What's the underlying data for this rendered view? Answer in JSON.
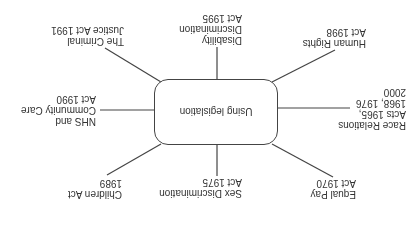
{
  "diagram": {
    "type": "mind-map",
    "orientation": "rotated 180 degrees",
    "center": "Using legislation",
    "branches": [
      {
        "id": "race",
        "lines": [
          "Race Relations",
          "Acts 1965,",
          "1968, 1976",
          "2000"
        ]
      },
      {
        "id": "human-rights",
        "lines": [
          "Human Rights",
          "Act 1998"
        ]
      },
      {
        "id": "disability",
        "lines": [
          "Disability",
          "Discrimination",
          "Act 1995"
        ]
      },
      {
        "id": "criminal",
        "lines": [
          "The Criminal",
          "Justice Act 1991"
        ]
      },
      {
        "id": "nhs",
        "lines": [
          "NHS and",
          "Community Care",
          "Act 1990"
        ]
      },
      {
        "id": "children",
        "lines": [
          "Children Act",
          "1989"
        ]
      },
      {
        "id": "sex",
        "lines": [
          "Sex Discrimination",
          "Act 1975"
        ]
      },
      {
        "id": "equal-pay",
        "lines": [
          "Equal Pay",
          "Act 1970"
        ]
      }
    ]
  },
  "colors": {
    "line": "#444444",
    "text": "#333333",
    "background": "#ffffff"
  }
}
